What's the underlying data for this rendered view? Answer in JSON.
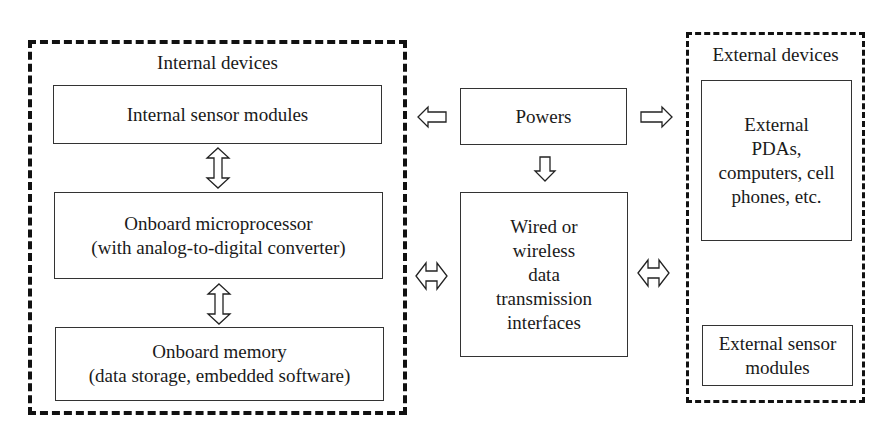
{
  "diagram": {
    "internal_group": {
      "title": "Internal devices",
      "boxes": [
        {
          "lines": [
            "Internal sensor modules"
          ]
        },
        {
          "lines": [
            "Onboard microprocessor",
            "(with analog-to-digital converter)"
          ]
        },
        {
          "lines": [
            "Onboard memory",
            "(data storage, embedded software)"
          ]
        }
      ]
    },
    "center": {
      "power_box": {
        "lines": [
          "Powers"
        ]
      },
      "transmission_box": {
        "lines": [
          "Wired or",
          "wireless",
          "data",
          "transmission",
          "interfaces"
        ]
      }
    },
    "external_group": {
      "title": "External devices",
      "boxes": [
        {
          "lines": [
            "External",
            "PDAs,",
            "computers, cell",
            "phones, etc."
          ]
        },
        {
          "lines": [
            "External sensor",
            "modules"
          ]
        }
      ]
    },
    "arrows": [
      {
        "from": "Internal sensor modules",
        "to": "Onboard microprocessor",
        "type": "bidirectional-vertical"
      },
      {
        "from": "Onboard microprocessor",
        "to": "Onboard memory",
        "type": "bidirectional-vertical"
      },
      {
        "from": "Powers",
        "to": "Internal devices",
        "type": "left"
      },
      {
        "from": "Powers",
        "to": "External devices",
        "type": "right"
      },
      {
        "from": "Powers",
        "to": "Wired or wireless data transmission interfaces",
        "type": "down"
      },
      {
        "from": "Internal devices",
        "to": "Wired or wireless data transmission interfaces",
        "type": "bidirectional-horizontal"
      },
      {
        "from": "Wired or wireless data transmission interfaces",
        "to": "External devices",
        "type": "bidirectional-horizontal"
      }
    ]
  }
}
